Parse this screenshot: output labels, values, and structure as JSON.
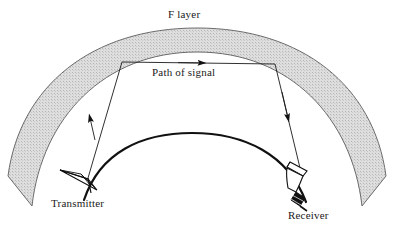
{
  "figure": {
    "type": "diagram",
    "background_color": "#ffffff",
    "line_color": "#1a1a1a"
  },
  "labels": {
    "f_layer": "F layer",
    "path_of_signal": "Path of signal",
    "transmitter": "Transmitter",
    "receiver": "Receiver"
  },
  "layers": {
    "ionosphere": {
      "name": "F layer",
      "fill_color": "#d9d9d9",
      "stroke_color": "#555555",
      "style": "stippled-band",
      "outer_apex_y": 28,
      "inner_apex_y": 52,
      "thickness_px": 24
    },
    "earth": {
      "name": "Earth surface",
      "stroke_color": "#111111",
      "apex_y": 133,
      "stroke_width": 2.2
    }
  },
  "signal_path": {
    "color": "#1a1a1a",
    "stroke_width": 0.9,
    "vertices": [
      {
        "name": "transmitter-apex",
        "x": 88,
        "y": 178
      },
      {
        "name": "reflection-left",
        "x": 122,
        "y": 62
      },
      {
        "name": "reflection-right",
        "x": 275,
        "y": 64
      },
      {
        "name": "receiver-horn",
        "x": 300,
        "y": 168
      }
    ],
    "arrows": [
      {
        "name": "uplink-arrow",
        "x": 92,
        "y": 118,
        "direction": "up-left"
      },
      {
        "name": "horizontal-arrow",
        "x": 200,
        "y": 62,
        "direction": "right"
      },
      {
        "name": "downlink-arrow",
        "x": 288,
        "y": 116,
        "direction": "down-right"
      }
    ]
  },
  "antennas": {
    "transmitter": {
      "style": "lattice-tower-triangle",
      "apex": {
        "x": 88,
        "y": 178
      },
      "base_left": {
        "x": 63,
        "y": 172
      },
      "base_right": {
        "x": 97,
        "y": 192
      }
    },
    "receiver": {
      "style": "horn-antenna-on-mast",
      "horn_tip": {
        "x": 300,
        "y": 166
      },
      "mast_color": "#111111"
    }
  }
}
